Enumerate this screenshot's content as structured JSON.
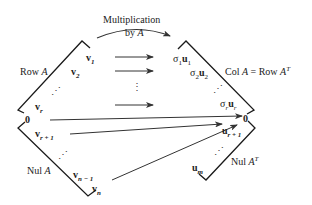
{
  "title": "Multiplication by A",
  "arc_label": {
    "line1": "Multiplication",
    "line2_pre": "by ",
    "line2_var": "A"
  },
  "left": {
    "row_label": {
      "text": "Row ",
      "var": "A"
    },
    "nul_label": {
      "text": "Nul ",
      "var": "A"
    },
    "vectors": [
      {
        "base": "v",
        "sub": "1"
      },
      {
        "base": "v",
        "sub": "2"
      },
      {
        "base": "v",
        "sub": "r"
      },
      {
        "base": "v",
        "sub": "r + 1"
      },
      {
        "base": "v",
        "sub": "n − 1"
      },
      {
        "base": "v",
        "sub": "n"
      }
    ],
    "zero": "0"
  },
  "right": {
    "col_label": {
      "text": "Col ",
      "var": "A",
      "eq": " = Row ",
      "var2": "A",
      "sup": "T"
    },
    "nul_label": {
      "text": "Nul ",
      "var": "A",
      "sup": "T"
    },
    "vectors": [
      {
        "sigma": "σ",
        "sigma_sub": "1",
        "base": "u",
        "sub": "1"
      },
      {
        "sigma": "σ",
        "sigma_sub": "2",
        "base": "u",
        "sub": "2"
      },
      {
        "sigma": "σ",
        "sigma_sub": "r",
        "base": "u",
        "sub": "r"
      },
      {
        "base": "u",
        "sub": "r + 1"
      },
      {
        "base": "u",
        "sub": "m"
      }
    ],
    "zero": "0"
  },
  "ellipsis_vertical": "⋮",
  "ellipsis_diag": "⋰",
  "colors": {
    "line": "#1a1a1a",
    "arrow": "#333333",
    "text": "#222222"
  }
}
